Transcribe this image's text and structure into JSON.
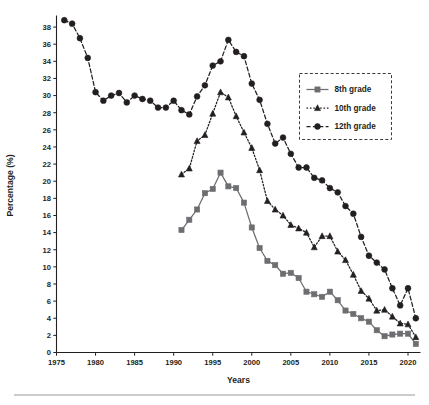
{
  "chart_data": {
    "type": "line",
    "title": "",
    "xlabel": "Years",
    "ylabel": "Percentage (%)",
    "xlim": [
      1975,
      2021.6
    ],
    "ylim": [
      0,
      39
    ],
    "xticks": [
      1975,
      1980,
      1985,
      1990,
      1995,
      2000,
      2005,
      2010,
      2015,
      2020
    ],
    "xticklabels": [
      "1975",
      "1980",
      "1985",
      "1990",
      "1995",
      "2000",
      "2005",
      "2010",
      "2015",
      "2020"
    ],
    "yticks": [
      0,
      2,
      4,
      6,
      8,
      10,
      12,
      14,
      16,
      18,
      20,
      22,
      24,
      26,
      28,
      30,
      32,
      34,
      36,
      38
    ],
    "yticklabels": [
      "0",
      "2",
      "4",
      "6",
      "8",
      "10",
      "12",
      "14",
      "16",
      "18",
      "20",
      "22",
      "24",
      "26",
      "28",
      "30",
      "32",
      "34",
      "36",
      "38"
    ],
    "grid": false,
    "legend_position": "upper right",
    "series": [
      {
        "name": "8th grade",
        "marker": "square",
        "color": "#6d6e71",
        "linestyle": "solid",
        "x": [
          1991,
          1992,
          1993,
          1994,
          1995,
          1996,
          1997,
          1998,
          1999,
          2000,
          2001,
          2002,
          2003,
          2004,
          2005,
          2006,
          2007,
          2008,
          2009,
          2010,
          2011,
          2012,
          2013,
          2014,
          2015,
          2016,
          2017,
          2018,
          2019,
          2020,
          2021
        ],
        "values": [
          14.3,
          15.5,
          16.7,
          18.6,
          19.1,
          21.0,
          19.4,
          19.2,
          17.5,
          14.6,
          12.2,
          10.7,
          10.2,
          9.2,
          9.3,
          8.7,
          7.1,
          6.8,
          6.5,
          7.1,
          6.1,
          4.9,
          4.5,
          4.0,
          3.6,
          2.6,
          1.9,
          2.1,
          2.2,
          2.2,
          1.0
        ]
      },
      {
        "name": "10th grade",
        "marker": "triangle",
        "color": "#231f20",
        "linestyle": "dotted",
        "x": [
          1991,
          1992,
          1993,
          1994,
          1995,
          1996,
          1997,
          1998,
          1999,
          2000,
          2001,
          2002,
          2003,
          2004,
          2005,
          2006,
          2007,
          2008,
          2009,
          2010,
          2011,
          2012,
          2013,
          2014,
          2015,
          2016,
          2017,
          2018,
          2019,
          2020,
          2021
        ],
        "values": [
          20.8,
          21.5,
          24.7,
          25.4,
          27.9,
          30.4,
          29.8,
          27.6,
          25.7,
          23.9,
          21.3,
          17.7,
          16.7,
          16.0,
          14.9,
          14.5,
          14.0,
          12.3,
          13.6,
          13.6,
          11.8,
          10.8,
          9.1,
          7.2,
          6.3,
          4.9,
          5.0,
          4.2,
          3.4,
          3.3,
          1.8
        ]
      },
      {
        "name": "12th grade",
        "marker": "circle",
        "color": "#231f20",
        "linestyle": "dashed",
        "x": [
          1976,
          1977,
          1978,
          1979,
          1980,
          1981,
          1982,
          1983,
          1984,
          1985,
          1986,
          1987,
          1988,
          1989,
          1990,
          1991,
          1992,
          1993,
          1994,
          1995,
          1996,
          1997,
          1998,
          1999,
          2000,
          2001,
          2002,
          2003,
          2004,
          2005,
          2006,
          2007,
          2008,
          2009,
          2010,
          2011,
          2012,
          2013,
          2014,
          2015,
          2016,
          2017,
          2018,
          2019,
          2020,
          2021
        ],
        "values": [
          38.8,
          38.4,
          36.7,
          34.4,
          30.4,
          29.4,
          30.0,
          30.3,
          29.2,
          30.0,
          29.6,
          29.4,
          28.6,
          28.6,
          29.4,
          28.3,
          27.8,
          29.9,
          31.2,
          33.5,
          34.0,
          36.5,
          35.1,
          34.6,
          31.4,
          29.5,
          26.7,
          24.4,
          25.1,
          23.2,
          21.6,
          21.6,
          20.4,
          20.1,
          19.2,
          18.7,
          17.1,
          16.2,
          13.5,
          11.3,
          10.5,
          9.7,
          7.5,
          5.5,
          7.5,
          4.0
        ]
      }
    ]
  },
  "legend": {
    "entries": [
      {
        "label": "8th grade"
      },
      {
        "label": "10th grade"
      },
      {
        "label": "12th grade"
      }
    ]
  }
}
